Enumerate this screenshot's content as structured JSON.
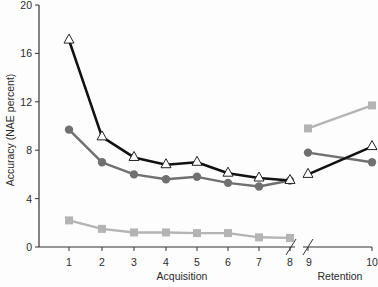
{
  "chart_data": {
    "type": "line",
    "title": "",
    "ylabel": "Accuracy (NAE percent)",
    "xlabel_segments": [
      "Acquisition",
      "Retention"
    ],
    "ylim": [
      0,
      20
    ],
    "yticks": [
      0,
      4,
      8,
      12,
      16,
      20
    ],
    "x": [
      1,
      2,
      3,
      4,
      5,
      6,
      7,
      8,
      9,
      10
    ],
    "x_groups": [
      {
        "label": "Acquisition",
        "x": [
          1,
          2,
          3,
          4,
          5,
          6,
          7,
          8
        ]
      },
      {
        "label": "Retention",
        "x": [
          9,
          10
        ]
      }
    ],
    "axis_break_between": [
      8,
      9
    ],
    "grid": false,
    "legend": null,
    "series": [
      {
        "name": "triangle-open-black",
        "marker": "open-triangle",
        "color": "#111111",
        "acquisition": [
          17.1,
          9.1,
          7.4,
          6.8,
          7.0,
          6.1,
          5.7,
          5.5
        ],
        "retention": [
          6.0,
          8.3
        ]
      },
      {
        "name": "circle-dark-gray",
        "marker": "filled-circle",
        "color": "#707070",
        "acquisition": [
          9.7,
          7.0,
          6.0,
          5.6,
          5.8,
          5.3,
          5.0,
          5.5
        ],
        "retention": [
          7.8,
          7.0
        ]
      },
      {
        "name": "square-light-gray",
        "marker": "filled-square",
        "color": "#b4b4b4",
        "acquisition": [
          2.2,
          1.5,
          1.2,
          1.2,
          1.15,
          1.15,
          0.8,
          0.75
        ],
        "retention": [
          9.8,
          11.7
        ]
      }
    ]
  },
  "labels": {
    "ylabel": "Accuracy (NAE percent)",
    "acq": "Acquisition",
    "ret": "Retention"
  }
}
